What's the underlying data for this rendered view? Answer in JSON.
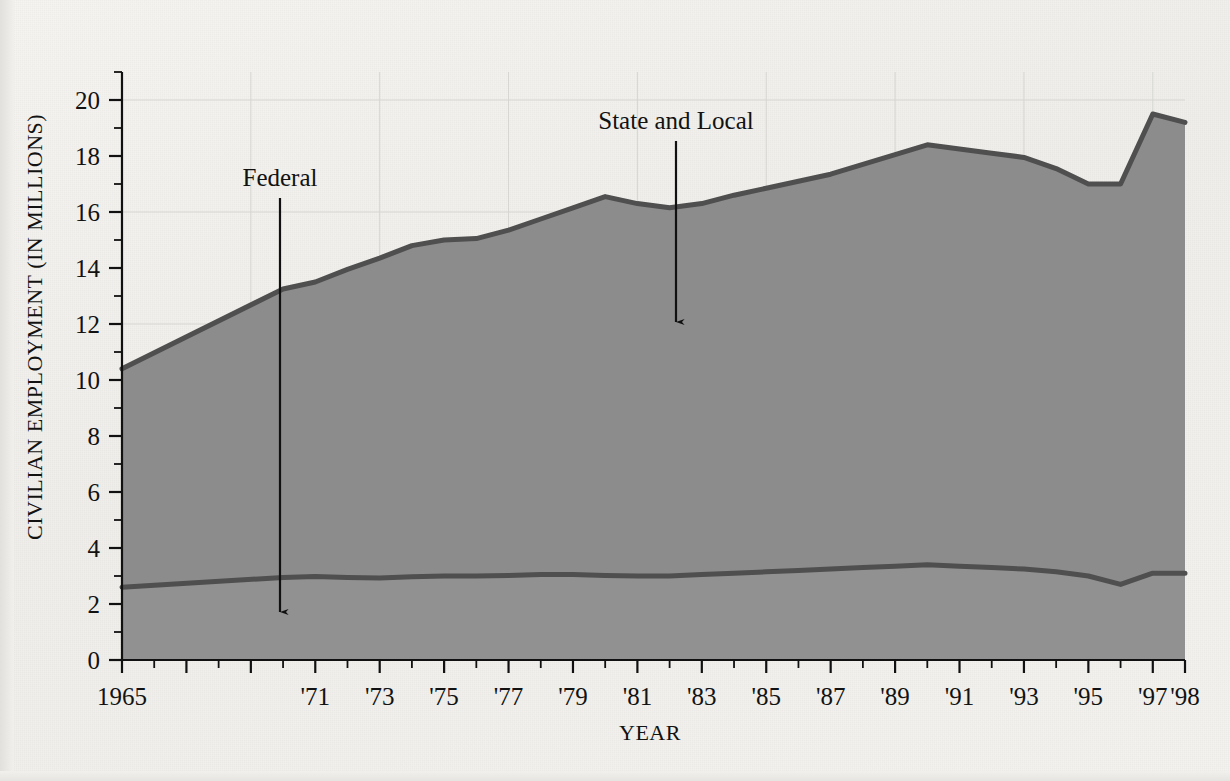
{
  "figure": {
    "background_color": "#f2f1ee",
    "ink_color": "#1a1a1a"
  },
  "axes": {
    "y_title": "CIVILIAN EMPLOYMENT (IN MILLIONS)",
    "x_title": "YEAR",
    "y_ticks": [
      "0",
      "2",
      "4",
      "6",
      "8",
      "10",
      "12",
      "14",
      "16",
      "18",
      "20"
    ],
    "x_tick_labels": [
      "1965",
      "'71",
      "'73",
      "'75",
      "'77",
      "'79",
      "'81",
      "'83",
      "'85",
      "'87",
      "'89",
      "'91",
      "'93",
      "'95",
      "'97",
      "'98"
    ]
  },
  "annotations": {
    "federal_label": "Federal",
    "state_local_label": "State and Local"
  },
  "chart_data": {
    "type": "area",
    "title": "",
    "xlabel": "YEAR",
    "ylabel": "CIVILIAN EMPLOYMENT (IN MILLIONS)",
    "xlim": [
      1965,
      1998
    ],
    "ylim": [
      0,
      21
    ],
    "grid": true,
    "legend_position": "in-plot-annotations",
    "stacked": true,
    "area_fill_color": "#8c8c8c",
    "line_color": "#4a4a4a",
    "x": [
      1965,
      1970,
      1971,
      1972,
      1973,
      1974,
      1975,
      1976,
      1977,
      1978,
      1979,
      1980,
      1981,
      1982,
      1983,
      1984,
      1985,
      1986,
      1987,
      1988,
      1989,
      1990,
      1991,
      1992,
      1993,
      1994,
      1995,
      1996,
      1997,
      1998
    ],
    "x_tick_values": [
      1965,
      1966,
      1967,
      1968,
      1969,
      1970,
      1971,
      1972,
      1973,
      1974,
      1975,
      1976,
      1977,
      1978,
      1979,
      1980,
      1981,
      1982,
      1983,
      1984,
      1985,
      1986,
      1987,
      1988,
      1989,
      1990,
      1991,
      1992,
      1993,
      1994,
      1995,
      1996,
      1997,
      1998
    ],
    "series": [
      {
        "name": "Federal",
        "values": [
          2.6,
          2.95,
          2.98,
          2.95,
          2.93,
          2.97,
          3.0,
          3.0,
          3.02,
          3.05,
          3.05,
          3.02,
          3.0,
          3.0,
          3.05,
          3.1,
          3.15,
          3.2,
          3.25,
          3.3,
          3.35,
          3.4,
          3.35,
          3.3,
          3.25,
          3.15,
          3.0,
          2.7,
          3.1,
          3.1
        ]
      },
      {
        "name": "State and Local",
        "values": [
          7.8,
          10.3,
          10.5,
          11.0,
          11.4,
          11.8,
          12.0,
          12.05,
          12.3,
          12.7,
          13.1,
          13.5,
          13.3,
          13.15,
          13.25,
          13.5,
          13.7,
          13.9,
          14.1,
          14.4,
          14.7,
          15.0,
          14.9,
          14.8,
          14.7,
          14.4,
          14.0,
          14.3,
          16.4,
          16.1
        ]
      }
    ],
    "totals": [
      10.4,
      13.25,
      13.5,
      13.95,
      14.35,
      14.8,
      15.0,
      15.05,
      15.35,
      15.75,
      16.15,
      16.55,
      16.3,
      16.15,
      16.3,
      16.6,
      16.85,
      17.1,
      17.35,
      17.7,
      18.05,
      18.4,
      18.25,
      18.1,
      17.95,
      17.55,
      17.0,
      17.0,
      19.5,
      19.2
    ]
  }
}
